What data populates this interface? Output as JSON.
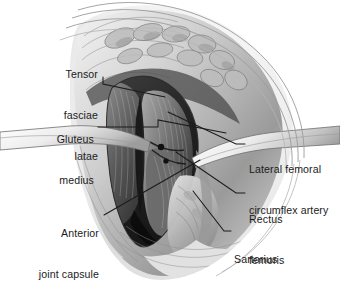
{
  "figure": {
    "type": "medical-illustration",
    "style": "grayscale pencil / airbrush anatomical drawing",
    "background_color": "#ffffff",
    "ink_color": "#1b1b1b",
    "label_font_size_px": 10.6
  },
  "labels": [
    {
      "id": "tensor-fasciae-latae",
      "lines": [
        "Tensor",
        "fasciae",
        "latae"
      ],
      "align": "right",
      "text_x": 98,
      "text_y": 41,
      "leader": [
        [
          103,
          77
        ],
        [
          103,
          84
        ],
        [
          165,
          97
        ]
      ]
    },
    {
      "id": "gluteus-medius",
      "lines": [
        "Gluteus",
        "medius"
      ],
      "align": "right",
      "text_x": 94,
      "text_y": 106,
      "leader": [
        [
          98,
          127
        ],
        [
          158,
          127
        ],
        [
          158,
          120
        ],
        [
          226,
          133
        ]
      ]
    },
    {
      "id": "anterior-joint-capsule",
      "lines": [
        "Anterior",
        "joint capsule"
      ],
      "align": "right",
      "text_x": 99,
      "text_y": 200,
      "leader": [
        [
          104,
          215
        ],
        [
          200,
          160
        ]
      ]
    },
    {
      "id": "lateral-femoral-circumflex-artery",
      "lines": [
        "Lateral femoral",
        "circumflex artery"
      ],
      "align": "left",
      "text_x": 249,
      "text_y": 136,
      "leader": [
        [
          245,
          144
        ],
        [
          236,
          144
        ],
        [
          168,
          112
        ]
      ]
    },
    {
      "id": "rectus-femoris",
      "lines": [
        "Rectus",
        "femoris"
      ],
      "align": "left",
      "text_x": 249,
      "text_y": 186,
      "leader": [
        [
          245,
          193
        ],
        [
          236,
          193
        ],
        [
          176,
          152
        ]
      ]
    },
    {
      "id": "sartorius",
      "lines": [
        "Sartorius"
      ],
      "align": "left",
      "text_x": 234,
      "text_y": 226,
      "leader": [
        [
          231,
          231
        ],
        [
          224,
          231
        ],
        [
          193,
          191
        ]
      ]
    }
  ]
}
